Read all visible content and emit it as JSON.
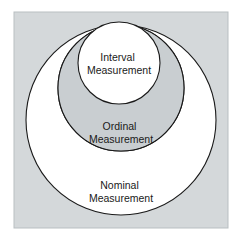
{
  "figure": {
    "panel": {
      "background_color": "#d4d8da",
      "border_color": "#b9bfc2",
      "outer_background_color": "#ffffff"
    },
    "circle_fill_color": "#ffffff",
    "circle_stroke_color": "#1a1a1a",
    "label_text_color": "#1a1a1a"
  },
  "circles": [
    {
      "id": "nominal",
      "level": "Nominal",
      "label_line1": "Nominal",
      "label_line2": "Measurement",
      "cx": 121,
      "cy": 120,
      "r": 95,
      "label_x": 121,
      "label_y": 186
    },
    {
      "id": "ordinal",
      "level": "Ordinal",
      "label_line1": "Ordinal",
      "label_line2": "Measurement",
      "cx": 121,
      "cy": 88,
      "r": 63,
      "label_x": 121,
      "label_y": 127
    },
    {
      "id": "interval",
      "level": "Interval",
      "label_line1": "Interval",
      "label_line2": "Measurement",
      "cx": 119,
      "cy": 63,
      "r": 41,
      "label_x": 119,
      "label_y": 58
    }
  ]
}
